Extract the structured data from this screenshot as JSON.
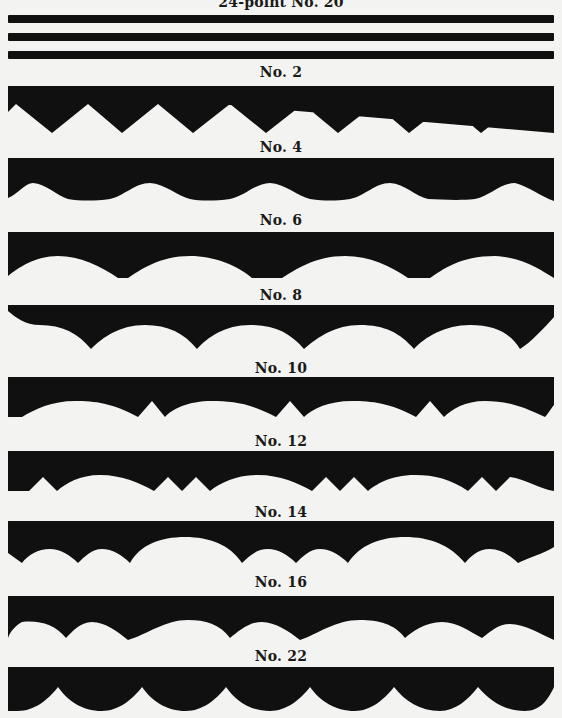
{
  "page": {
    "title_cut": "24-point No. 20",
    "ink_color": "#101010",
    "paper_color": "#f3f3f1"
  },
  "specimens": [
    {
      "label": "24-point No. 20",
      "pattern": "three-parallel-rules"
    },
    {
      "label": "No. 2",
      "pattern": "zigzag"
    },
    {
      "label": "No. 4",
      "pattern": "wave-bumps"
    },
    {
      "label": "No. 6",
      "pattern": "shallow-arches"
    },
    {
      "label": "No. 8",
      "pattern": "pointed-arches"
    },
    {
      "label": "No. 10",
      "pattern": "arches-with-spikes"
    },
    {
      "label": "No. 12",
      "pattern": "arches-with-double-teeth"
    },
    {
      "label": "No. 14",
      "pattern": "large-and-small-scallops"
    },
    {
      "label": "No. 16",
      "pattern": "scallops-with-notches"
    },
    {
      "label": "No. 22",
      "pattern": "deep-scallops"
    }
  ]
}
